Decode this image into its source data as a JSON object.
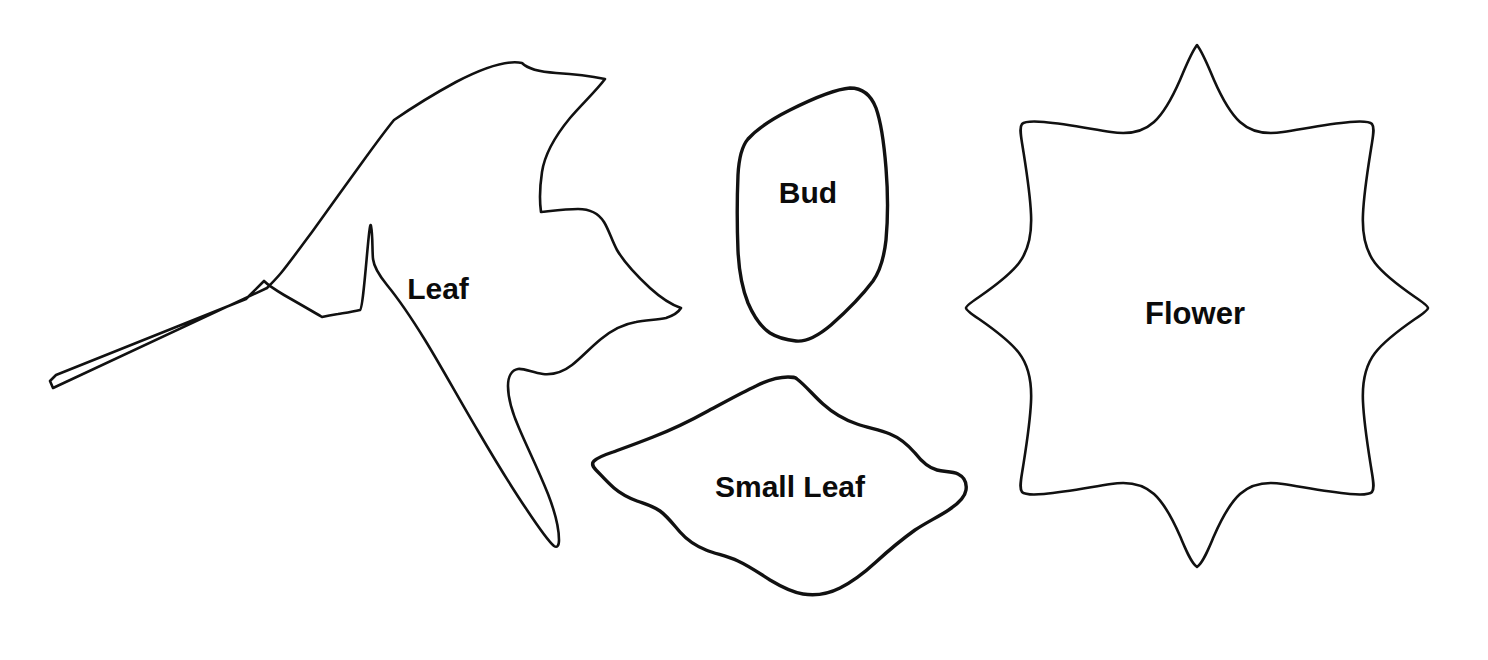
{
  "document": {
    "type": "pattern-template-sheet",
    "background_color": "#ffffff",
    "stroke_color": "#111111",
    "label_color": "#0b0b0b",
    "canvas": {
      "width": 1488,
      "height": 660
    }
  },
  "shapes": [
    {
      "id": "leaf",
      "label": "Leaf",
      "label_x": 438,
      "label_y": 291,
      "label_size": 30,
      "stroke_width": 2.6,
      "description": "large maple-like leaf outline with long tapered stem pointing lower-left",
      "bbox": {
        "x": 50,
        "y": 60,
        "width": 636,
        "height": 490
      }
    },
    {
      "id": "bud",
      "label": "Bud",
      "label_x": 808,
      "label_y": 195,
      "label_size": 30,
      "stroke_width": 3.4,
      "description": "rounded kite / teardrop bud outline",
      "bbox": {
        "x": 736,
        "y": 86,
        "width": 152,
        "height": 255
      }
    },
    {
      "id": "small-leaf",
      "label": "Small Leaf",
      "label_x": 790,
      "label_y": 489,
      "label_size": 30,
      "stroke_width": 3.4,
      "description": "wavy rounded diamond small leaf outline",
      "bbox": {
        "x": 592,
        "y": 378,
        "width": 375,
        "height": 218
      }
    },
    {
      "id": "flower",
      "label": "Flower",
      "label_x": 1195,
      "label_y": 316,
      "label_size": 31,
      "stroke_width": 2.6,
      "description": "eight pointed star flower outline with concave scalloped edges",
      "bbox": {
        "x": 966,
        "y": 44,
        "width": 464,
        "height": 524
      }
    }
  ],
  "geometry": {
    "leaf_path": "M 522 63 C 529 70 541 72 556 73 C 572 74 590 76 605 79 C 596 91 582 104 570 118 C 556 135 545 152 542 172 C 539 192 540 205 541 212 C 551 211 566 209 578 209 C 590 209 599 214 604 222 C 609 230 612 241 617 250 C 624 262 636 275 650 288 C 661 298 672 305 681 308 C 678 313 672 316 666 318 C 657 320 646 320 636 322 C 624 324 612 330 601 339 C 590 348 581 358 572 365 C 563 372 553 375 543 374 C 533 373 524 368 518 369 C 512 370 508 376 508 386 C 508 398 512 412 519 428 C 527 447 538 469 548 494 C 555 512 559 528 559 540 C 559 546 557 548 554 546 C 548 541 539 528 527 510 C 512 488 495 460 478 431 C 459 399 441 366 425 340 C 409 314 396 296 387 285 C 378 274 374 267 373 259 C 372 248 373 237 371 226 C 369 215 364 308 360 310 C 352 312 344 313 338 314 C 331 315 326 316 322 317 C 312 311 298 303 284 295 C 274 289 267 284 264 281 C 259 286 253 292 246 299 L 56 375 L 50 381 L 53 388 L 267 288 C 271 284 276 279 281 273 C 290 262 300 248 312 232 C 327 211 345 186 361 164 C 374 146 385 131 394 120 C 410 109 432 95 456 82 C 483 68 508 60 522 63 Z",
    "leaf_stem_path": "M 264 281 L 56 375 L 50 381 L 53 388 L 267 288",
    "bud_path": "M 850 88 C 862 88 871 95 876 108 C 881 122 884 143 886 168 C 888 193 888 218 886 240 C 884 258 880 271 873 281 C 864 293 848 310 831 325 C 818 336 806 342 796 341 C 787 340 778 338 770 333 C 761 327 754 317 748 303 C 742 288 739 271 738 251 C 737 226 737 199 738 175 C 739 156 742 146 748 139 C 757 129 772 119 790 110 C 812 99 836 89 850 88 Z",
    "small_leaf_path": "M 797 379 C 806 386 814 396 823 404 C 833 413 845 420 857 424 C 869 428 880 430 890 434 C 900 438 908 445 915 453 C 922 462 929 468 937 470 C 944 472 952 471 958 474 C 964 477 967 483 966 490 C 965 497 959 503 950 509 C 940 516 927 522 915 530 C 901 540 888 551 876 562 C 864 573 852 582 840 588 C 828 594 815 596 803 594 C 791 592 780 586 770 580 C 759 573 749 566 738 561 C 727 556 716 554 706 550 C 696 546 687 540 680 532 C 673 524 667 516 660 511 C 653 506 645 504 637 501 C 629 498 621 494 614 488 C 607 482 601 475 596 470 C 592 466 592 463 594 461 C 597 458 604 455 613 452 C 624 448 638 443 653 437 C 671 430 690 421 708 411 C 725 402 741 393 756 386 C 768 380 780 377 788 377 C 793 377 795 377 797 379 Z",
    "flower_path": "M 1197 45 C 1203 53 1208 66 1214 80 C 1221 96 1229 112 1240 122 C 1251 132 1265 135 1283 132 C 1303 129 1327 124 1350 122 C 1362 121 1369 121 1372 124 C 1375 128 1373 136 1371 149 C 1368 168 1364 192 1363 214 C 1362 234 1365 250 1375 263 C 1385 276 1402 288 1415 297 C 1424 303 1428 306 1428 308 C 1428 310 1424 313 1415 319 C 1402 328 1385 340 1375 353 C 1365 366 1362 382 1363 402 C 1364 424 1368 448 1371 467 C 1373 480 1375 488 1372 492 C 1369 495 1362 495 1350 494 C 1327 492 1303 487 1283 484 C 1265 481 1251 484 1240 494 C 1229 504 1221 520 1214 536 C 1208 550 1203 563 1197 567 C 1191 563 1186 550 1180 536 C 1173 520 1165 504 1154 494 C 1143 484 1129 481 1111 484 C 1091 487 1067 492 1044 494 C 1032 495 1025 495 1022 492 C 1019 488 1021 480 1023 467 C 1026 448 1030 424 1031 402 C 1032 382 1029 366 1019 353 C 1009 340 992 328 979 319 C 970 313 966 310 966 308 C 966 306 970 303 979 297 C 992 288 1009 276 1019 263 C 1029 250 1032 234 1031 214 C 1030 192 1026 168 1023 149 C 1021 136 1019 128 1022 124 C 1025 121 1032 121 1044 122 C 1067 124 1091 129 1111 132 C 1129 135 1143 132 1154 122 C 1165 112 1173 96 1180 80 C 1186 66 1191 53 1197 45 Z"
  }
}
